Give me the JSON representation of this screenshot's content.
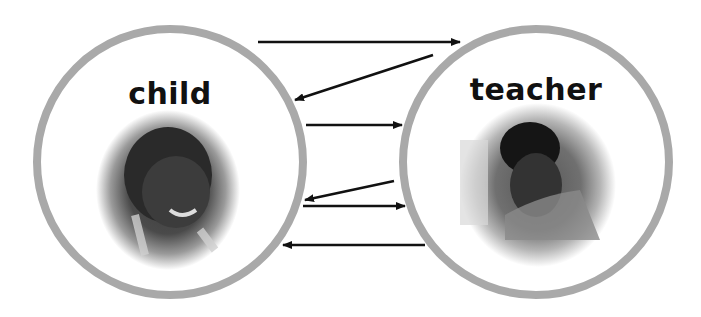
{
  "diagram": {
    "nodes": [
      {
        "id": "child",
        "label": "child",
        "photo": "baby-photo",
        "cx": 170,
        "cy": 162,
        "r": 133
      },
      {
        "id": "teacher",
        "label": "teacher",
        "photo": "teacher-photo",
        "cx": 536,
        "cy": 162,
        "r": 133
      }
    ],
    "arrows": [
      {
        "from": "child",
        "to": "teacher",
        "x1": 258,
        "y1": 42,
        "x2": 460,
        "y2": 42
      },
      {
        "from": "teacher",
        "to": "child",
        "x1": 433,
        "y1": 55,
        "x2": 295,
        "y2": 100
      },
      {
        "from": "child",
        "to": "teacher",
        "x1": 306,
        "y1": 125,
        "x2": 402,
        "y2": 125
      },
      {
        "from": "teacher",
        "to": "child",
        "x1": 394,
        "y1": 181,
        "x2": 305,
        "y2": 200
      },
      {
        "from": "child",
        "to": "teacher",
        "x1": 303,
        "y1": 206,
        "x2": 405,
        "y2": 206
      },
      {
        "from": "teacher",
        "to": "child",
        "x1": 425,
        "y1": 245,
        "x2": 283,
        "y2": 245
      }
    ],
    "colors": {
      "ring": "#a9a9a9",
      "arrow": "#111111",
      "text": "#111111"
    }
  }
}
